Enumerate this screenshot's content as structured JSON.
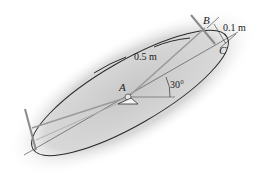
{
  "diagram": {
    "labels": {
      "point_a": "A",
      "point_b": "B",
      "point_c": "C",
      "length_ac": "0.5 m",
      "offset_bc": "0.1 m",
      "angle": "30°"
    },
    "colors": {
      "shadow": "#cfcfcf",
      "plate_outline": "#2a2a2a",
      "rod": "#9a9a9a",
      "text": "#1a1a1a"
    }
  }
}
